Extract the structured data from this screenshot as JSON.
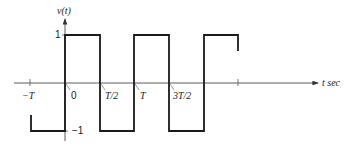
{
  "diagram": {
    "y_axis_label": "v(t)",
    "x_axis_label": "t sec",
    "y_ticks": [
      {
        "label": "1",
        "value": 1
      },
      {
        "label": "−1",
        "value": -1
      }
    ],
    "x_ticks": [
      {
        "label": "−T",
        "value": -1.0
      },
      {
        "label": "0",
        "value": 0.0
      },
      {
        "label": "T/2",
        "value": 0.5
      },
      {
        "label": "T",
        "value": 1.0
      },
      {
        "label": "3T/2",
        "value": 1.5
      },
      {
        "label": "",
        "value": 2.0
      }
    ],
    "waveform": {
      "type": "square",
      "amplitude": 1,
      "period": "T",
      "segments": [
        {
          "from": "-T",
          "to": "0",
          "level": -1
        },
        {
          "from": "0",
          "to": "T/2",
          "level": 1
        },
        {
          "from": "T/2",
          "to": "T",
          "level": -1
        },
        {
          "from": "T",
          "to": "3T/2",
          "level": 1
        },
        {
          "from": "3T/2",
          "to": "2T",
          "level": -1
        },
        {
          "from": "2T",
          "to": "5T/2",
          "level": 1
        }
      ]
    },
    "colors": {
      "line": "#1a1a1a",
      "axis": "#333333"
    }
  }
}
